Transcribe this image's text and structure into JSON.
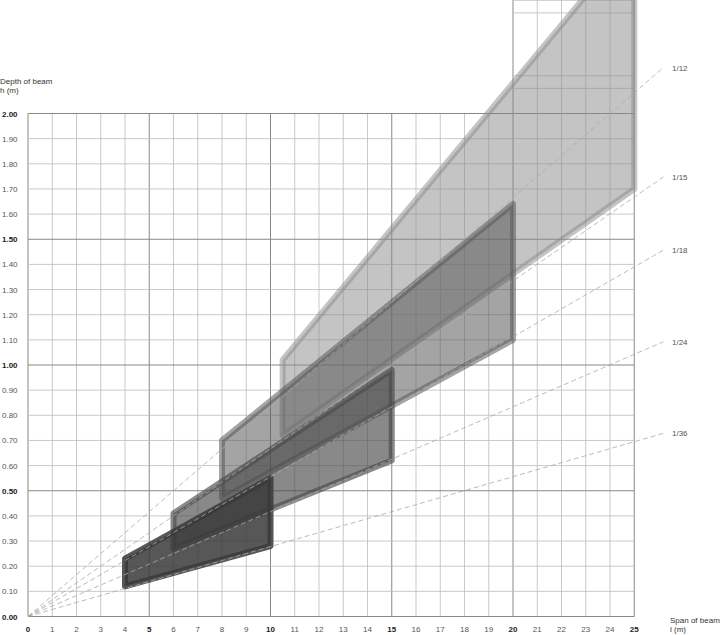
{
  "chart_data": {
    "type": "area",
    "title": "",
    "ylabel": "Depth of beam",
    "ylabel_unit": "h (m)",
    "xlabel": "Span of beam",
    "xlabel_unit": "l (m)",
    "xlim": [
      0,
      25
    ],
    "ylim": [
      0,
      2.0
    ],
    "grid": true,
    "x_ticks": [
      0,
      1,
      2,
      3,
      4,
      5,
      6,
      7,
      8,
      9,
      10,
      11,
      12,
      13,
      14,
      15,
      16,
      17,
      18,
      19,
      20,
      21,
      22,
      23,
      24,
      25
    ],
    "x_ticks_bold": [
      0,
      5,
      10,
      15,
      20,
      25
    ],
    "y_ticks": [
      "0.00",
      "0.10",
      "0.20",
      "0.30",
      "0.40",
      "0.50",
      "0.60",
      "0.70",
      "0.80",
      "0.90",
      "1.00",
      "1.10",
      "1.20",
      "1.30",
      "1.40",
      "1.50",
      "1.60",
      "1.70",
      "1.80",
      "1.90",
      "2.00"
    ],
    "y_ticks_bold": [
      "0.00",
      "0.50",
      "1.00",
      "1.50",
      "2.00"
    ],
    "ratio_lines": [
      {
        "label": "1/12",
        "slope": 0.0833
      },
      {
        "label": "1/15",
        "slope": 0.0667
      },
      {
        "label": "1/18",
        "slope": 0.0556
      },
      {
        "label": "1/24",
        "slope": 0.0417
      },
      {
        "label": "1/36",
        "slope": 0.0278
      }
    ],
    "series": [
      {
        "name": "band-4-10",
        "shade": "#3a3a3a",
        "opacity": 0.85,
        "polygon": [
          [
            4,
            0.12
          ],
          [
            4,
            0.23
          ],
          [
            10,
            0.55
          ],
          [
            10,
            0.28
          ]
        ]
      },
      {
        "name": "band-6-15",
        "shade": "#4a4a4a",
        "opacity": 0.65,
        "polygon": [
          [
            6,
            0.27
          ],
          [
            6,
            0.41
          ],
          [
            15,
            0.98
          ],
          [
            15,
            0.62
          ]
        ]
      },
      {
        "name": "band-8-20",
        "shade": "#5a5a5a",
        "opacity": 0.55,
        "polygon": [
          [
            8,
            0.47
          ],
          [
            8,
            0.7
          ],
          [
            20,
            1.64
          ],
          [
            20,
            1.1
          ]
        ]
      },
      {
        "name": "band-10-25",
        "shade": "#8a8a8a",
        "opacity": 0.5,
        "polygon": [
          [
            10.5,
            0.72
          ],
          [
            10.5,
            1.02
          ],
          [
            25,
            2.7
          ],
          [
            25,
            1.7
          ]
        ]
      }
    ]
  },
  "labels": {
    "y_title": "Depth of beam",
    "y_unit": "h (m)",
    "x_title": "Span of beam",
    "x_unit": "l (m)"
  }
}
